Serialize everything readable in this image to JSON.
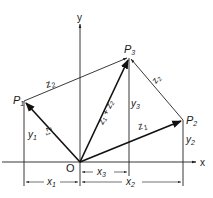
{
  "diagram": {
    "axes": {
      "x_label": "x",
      "y_label": "y",
      "origin_label": "O"
    },
    "points": {
      "p1": {
        "label": "P",
        "sub": "1"
      },
      "p2": {
        "label": "P",
        "sub": "2"
      },
      "p3": {
        "label": "P",
        "sub": "3"
      }
    },
    "vectors": {
      "op1": {
        "label": "z",
        "sub": "2"
      },
      "op2": {
        "label": "z",
        "sub": "1"
      },
      "op3": {
        "label": "z₁ + z₂"
      },
      "p1p3": {
        "label": "z",
        "sub": "1"
      },
      "p2p3": {
        "label": "z",
        "sub": "2"
      }
    },
    "dimensions": {
      "x1": {
        "label": "x",
        "sub": "1"
      },
      "x2": {
        "label": "x",
        "sub": "2"
      },
      "x3": {
        "label": "x",
        "sub": "3"
      },
      "y1": {
        "label": "y",
        "sub": "1"
      },
      "y2": {
        "label": "y",
        "sub": "2"
      },
      "y3": {
        "label": "y",
        "sub": "3"
      }
    }
  }
}
